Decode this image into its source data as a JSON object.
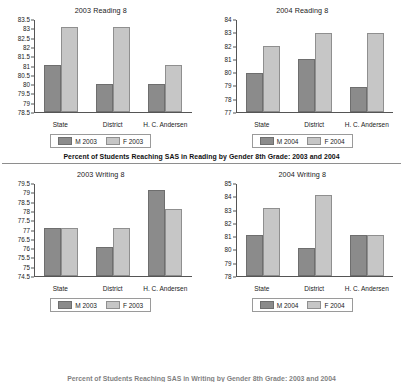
{
  "figure": {
    "middle_caption": "Percent of Students Reaching SAS in Reading by Gender 8th Grade: 2003 and 2004",
    "bottom_caption": "Percent of Students Reaching SAS in Writing by Gender 8th Grade: 2003 and 2004",
    "colors": {
      "male_bar": "#8b8b8b",
      "female_bar": "#c6c6c6",
      "axis": "#555555",
      "rule": "#8e8e8e"
    }
  },
  "chart_data": [
    {
      "id": "reading-2003",
      "type": "bar",
      "title": "2003 Reading 8",
      "categories": [
        "State",
        "District",
        "H. C. Andersen"
      ],
      "series": [
        {
          "name": "M 2003",
          "values": [
            81.05,
            80.0,
            80.0
          ]
        },
        {
          "name": "F 2003",
          "values": [
            83.1,
            83.1,
            81.05
          ]
        }
      ],
      "ticks": [
        "78.5",
        "79",
        "79.5",
        "80",
        "80.5",
        "81",
        "81.5",
        "82",
        "82.5",
        "83",
        "83.5"
      ],
      "ylim": [
        78.5,
        83.5
      ],
      "xlabel": "",
      "ylabel": "",
      "grid": false,
      "legend_position": "bottom"
    },
    {
      "id": "reading-2004",
      "type": "bar",
      "title": "2004 Reading 8",
      "categories": [
        "State",
        "District",
        "H. C. Andersen"
      ],
      "series": [
        {
          "name": "M 2004",
          "values": [
            80.0,
            81.05,
            78.9
          ]
        },
        {
          "name": "F 2004",
          "values": [
            82.05,
            83.05,
            83.05
          ]
        }
      ],
      "ticks": [
        "77",
        "78",
        "79",
        "80",
        "81",
        "82",
        "83",
        "84"
      ],
      "ylim": [
        77,
        84
      ],
      "xlabel": "",
      "ylabel": "",
      "grid": false,
      "legend_position": "bottom"
    },
    {
      "id": "writing-2003",
      "type": "bar",
      "title": "2003 Writing 8",
      "categories": [
        "State",
        "District",
        "H. C. Andersen"
      ],
      "series": [
        {
          "name": "M 2003",
          "values": [
            77.1,
            76.05,
            79.2
          ]
        },
        {
          "name": "F 2003",
          "values": [
            77.1,
            77.1,
            78.15
          ]
        }
      ],
      "ticks": [
        "74.5",
        "75",
        "75.5",
        "76",
        "76.5",
        "77",
        "77.5",
        "78",
        "78.5",
        "79",
        "79.5"
      ],
      "ylim": [
        74.5,
        79.5
      ],
      "xlabel": "",
      "ylabel": "",
      "grid": false,
      "legend_position": "bottom"
    },
    {
      "id": "writing-2004",
      "type": "bar",
      "title": "2004 Writing 8",
      "categories": [
        "State",
        "District",
        "H. C. Andersen"
      ],
      "series": [
        {
          "name": "M 2004",
          "values": [
            81.1,
            80.1,
            81.1
          ]
        },
        {
          "name": "F 2004",
          "values": [
            83.2,
            84.2,
            81.1
          ]
        }
      ],
      "ticks": [
        "78",
        "79",
        "80",
        "81",
        "82",
        "83",
        "84",
        "85"
      ],
      "ylim": [
        78,
        85
      ],
      "xlabel": "",
      "ylabel": "",
      "grid": false,
      "legend_position": "bottom"
    }
  ]
}
